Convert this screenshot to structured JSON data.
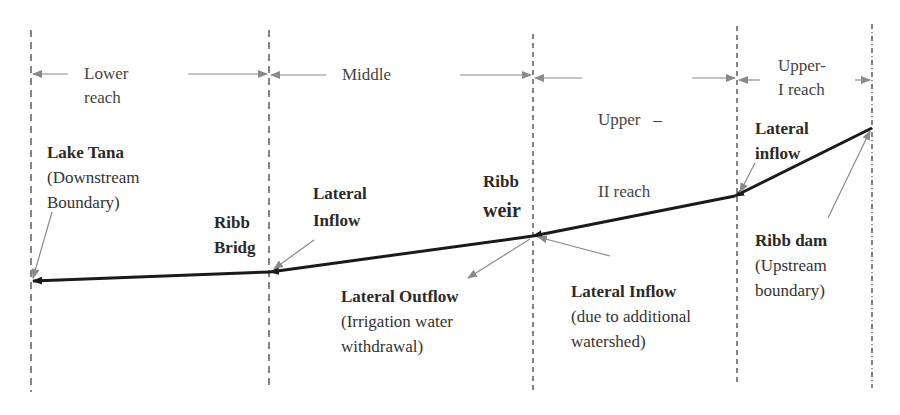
{
  "reaches": [
    {
      "line1": "Lower",
      "line2": "reach"
    },
    {
      "line1": "Middle",
      "line2": ""
    },
    {
      "line1": "Upper   –",
      "line2": "II reach"
    },
    {
      "line1": "Upper-",
      "line2": "I reach"
    }
  ],
  "labels": {
    "lake_tana": {
      "title": "Lake Tana",
      "line2": "(Downstream",
      "line3": "Boundary)"
    },
    "ribb_bridge": {
      "line1": "Ribb",
      "line2": "Bridg"
    },
    "lateral_inflow_middle": {
      "line1": "Lateral",
      "line2": "Inflow"
    },
    "ribb_weir": {
      "line1": "Ribb",
      "line2": "weir"
    },
    "lateral_outflow": {
      "title": "Lateral Outflow",
      "line2": "(Irrigation water",
      "line3": "withdrawal)"
    },
    "lateral_inflow_upper2": {
      "title": "Lateral Inflow",
      "line2": "(due to additional",
      "line3": "watershed)"
    },
    "lateral_inflow_upper1": {
      "line1": "Lateral",
      "line2": "inflow"
    },
    "ribb_dam": {
      "title": "Ribb dam",
      "line2": "(Upstream",
      "line3": "boundary)"
    }
  },
  "colors": {
    "river_line": "#1a1a1a",
    "pointer": "#888888",
    "dashed": "#444444"
  }
}
